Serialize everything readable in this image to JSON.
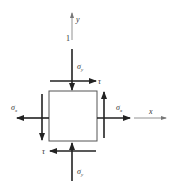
{
  "diagram": {
    "colors": {
      "stroke": "#222222",
      "axis": "#777777",
      "element": "#555555",
      "text": "#333333"
    },
    "axes": {
      "x_label": "x",
      "y_label": "y",
      "marker_label": "1"
    },
    "element": {
      "shape": "square"
    },
    "stresses": {
      "sigma_y_top": {
        "symbol": "σ",
        "subscript": "y",
        "direction": "down"
      },
      "sigma_y_bottom": {
        "symbol": "σ",
        "subscript": "y",
        "direction": "up"
      },
      "sigma_x_left": {
        "symbol": "σ",
        "subscript": "x",
        "direction": "left"
      },
      "sigma_x_right": {
        "symbol": "σ",
        "subscript": "x",
        "direction": "right"
      },
      "tau_top": {
        "symbol": "τ",
        "direction": "right"
      },
      "tau_bottom": {
        "symbol": "τ",
        "direction": "left"
      },
      "tau_left": {
        "direction": "down"
      },
      "tau_right": {
        "direction": "up"
      }
    }
  }
}
